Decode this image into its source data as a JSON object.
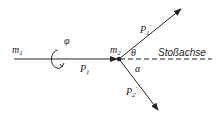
{
  "diagram": {
    "type": "collision-diagram",
    "labels": {
      "m1": "m",
      "m1_sub": "1",
      "m2": "m",
      "m2_sub": "2",
      "phi": "φ",
      "P1": "P",
      "P1_sub": "1",
      "P1_prime": "P",
      "P1_prime_sub": "1",
      "P2_prime": "P",
      "P2_prime_sub": "2",
      "theta": "θ",
      "alpha": "α",
      "axis": "Stoßachse"
    },
    "colors": {
      "line": "#222222"
    }
  }
}
